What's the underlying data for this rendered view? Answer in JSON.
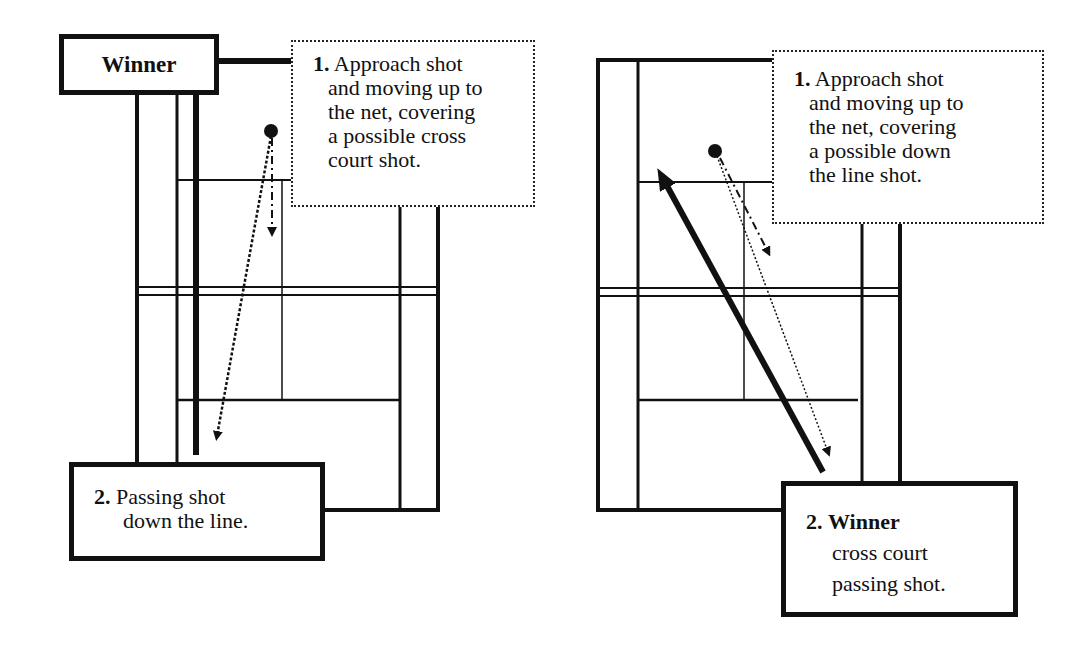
{
  "left_panel": {
    "winner_label": "Winner",
    "callout_1": {
      "number": "1.",
      "lines": [
        "Approach shot",
        "and moving up to",
        "the net, covering",
        "a possible cross",
        "court shot."
      ]
    },
    "callout_2": {
      "number": "2.",
      "lines": [
        "Passing shot",
        "down the line."
      ]
    }
  },
  "right_panel": {
    "callout_1": {
      "number": "1.",
      "lines": [
        "Approach shot",
        "and moving up to",
        "the net, covering",
        "a possible down",
        "the line shot."
      ]
    },
    "callout_2": {
      "number": "2.",
      "title": "Winner",
      "lines": [
        "cross court",
        "passing shot."
      ]
    }
  },
  "colors": {
    "line": "#111111",
    "background": "#ffffff"
  }
}
